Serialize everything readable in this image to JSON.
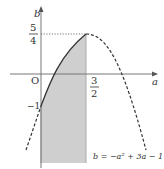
{
  "figure": {
    "axes": {
      "x_label": "a",
      "y_label": "b",
      "origin_label": "O"
    },
    "ticks": {
      "y_top_num": "5",
      "y_top_den": "4",
      "y_neg": "−1",
      "x_num": "3",
      "x_den": "2"
    },
    "equation": "b = −a² + 3a − 1",
    "curve": {
      "function": "b = -a^2 + 3a - 1",
      "vertex": [
        1.5,
        1.25
      ],
      "b_intercept": -1,
      "solid_range": [
        0,
        1.5
      ],
      "dashed_ranges": [
        [
          -0.3,
          0
        ],
        [
          1.5,
          3.5
        ]
      ]
    },
    "shaded_region": {
      "a_range": [
        0,
        1.5
      ],
      "description": "region below the curve between a=0 and a=3/2"
    },
    "colors": {
      "curve": "#333333",
      "shade": "#cfcfcf",
      "axis": "#777777"
    }
  }
}
